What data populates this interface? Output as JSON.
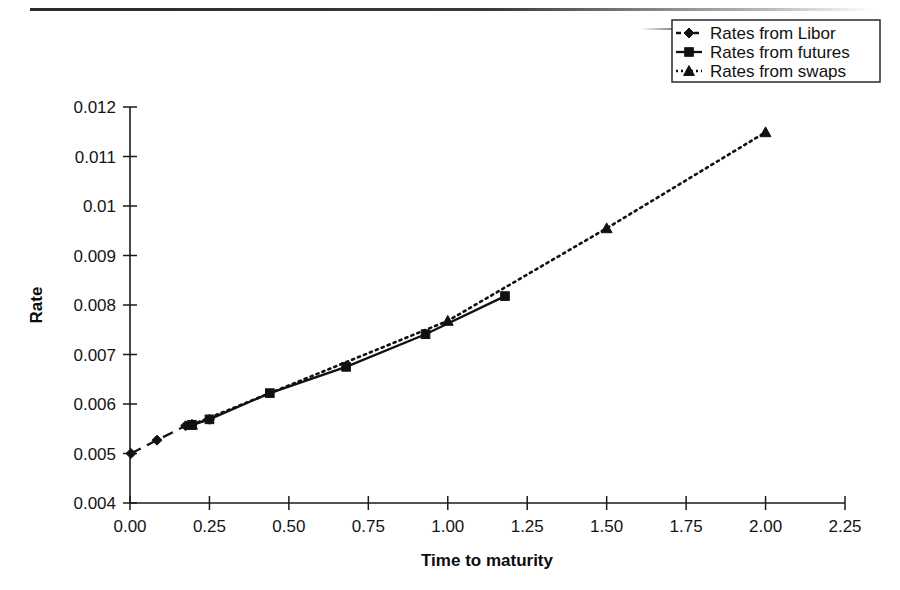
{
  "figure": {
    "background_color": "#ffffff",
    "ink_color": "#111111"
  },
  "chart_data": {
    "type": "line",
    "title": "",
    "xlabel": "Time to maturity",
    "ylabel": "Rate",
    "xlim": [
      0,
      2.25
    ],
    "ylim": [
      0.004,
      0.012
    ],
    "grid": false,
    "legend_position": "top-right",
    "xticks": [
      "0.00",
      "0.25",
      "0.50",
      "0.75",
      "1.00",
      "1.25",
      "1.50",
      "1.75",
      "2.00",
      "2.25"
    ],
    "xtick_values": [
      0,
      0.25,
      0.5,
      0.75,
      1.0,
      1.25,
      1.5,
      1.75,
      2.0,
      2.25
    ],
    "yticks": [
      "0.004",
      "0.005",
      "0.006",
      "0.007",
      "0.008",
      "0.009",
      "0.01",
      "0.011",
      "0.012"
    ],
    "ytick_values": [
      0.004,
      0.005,
      0.006,
      0.007,
      0.008,
      0.009,
      0.01,
      0.011,
      0.012
    ],
    "series": [
      {
        "name": "Rates from Libor",
        "marker": "diamond",
        "linestyle": "dashed",
        "color": "#111111",
        "x": [
          0.003,
          0.085,
          0.175,
          0.195,
          0.25
        ],
        "y": [
          0.005,
          0.00527,
          0.00556,
          0.00558,
          0.00569
        ]
      },
      {
        "name": "Rates from futures",
        "marker": "square",
        "linestyle": "solid",
        "color": "#111111",
        "x": [
          0.195,
          0.25,
          0.44,
          0.68,
          0.93,
          1.18
        ],
        "y": [
          0.00558,
          0.00569,
          0.00622,
          0.00675,
          0.00741,
          0.00818
        ]
      },
      {
        "name": "Rates from swaps",
        "marker": "triangle",
        "linestyle": "dotted",
        "color": "#111111",
        "x": [
          0.195,
          1.0,
          1.5,
          2.0
        ],
        "y": [
          0.00558,
          0.00768,
          0.00955,
          0.01149
        ]
      }
    ]
  },
  "legend": {
    "entries": [
      {
        "label": "Rates from Libor"
      },
      {
        "label": "Rates from futures"
      },
      {
        "label": "Rates from swaps"
      }
    ]
  }
}
